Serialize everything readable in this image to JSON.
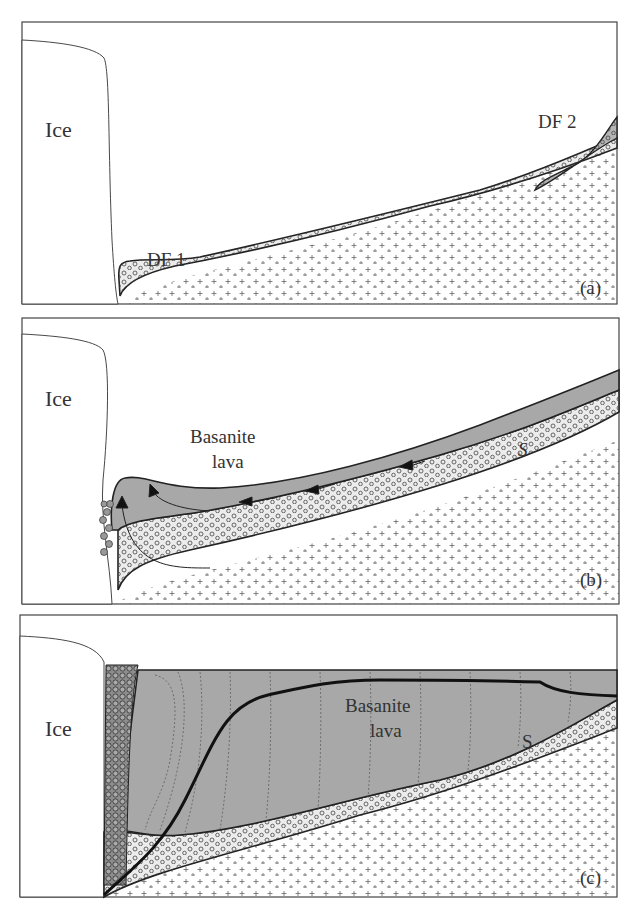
{
  "figure": {
    "colors": {
      "frame": "#444444",
      "outline": "#222222",
      "lava_fill": "#a8a8a8",
      "debris_fill": "#ececec",
      "df2_fill": "#b4b4b4",
      "breccia_fill": "#8c8c8c",
      "plus": "#555555"
    },
    "panels": [
      {
        "id": "a",
        "tag": "(a)",
        "labels": {
          "ice": "Ice",
          "df1": "DF 1",
          "df2": "DF 2"
        }
      },
      {
        "id": "b",
        "tag": "(b)",
        "labels": {
          "ice": "Ice",
          "lava_line1": "Basanite",
          "lava_line2": "lava",
          "s": "S"
        }
      },
      {
        "id": "c",
        "tag": "(c)",
        "labels": {
          "ice": "Ice",
          "lava_line1": "Basanite",
          "lava_line2": "lava",
          "s": "S"
        }
      }
    ]
  }
}
